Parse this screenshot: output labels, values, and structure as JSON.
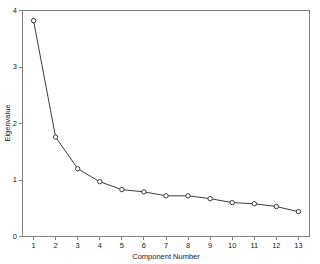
{
  "chart_data": {
    "type": "line",
    "title": "",
    "subtitle": "",
    "xlabel": "Component Number",
    "ylabel": "Eigenvalue",
    "categories": [
      1,
      2,
      3,
      4,
      5,
      6,
      7,
      8,
      9,
      10,
      11,
      12,
      13
    ],
    "x": [
      1,
      2,
      3,
      4,
      5,
      6,
      7,
      8,
      9,
      10,
      11,
      12,
      13
    ],
    "values": [
      3.82,
      1.76,
      1.2,
      0.97,
      0.83,
      0.79,
      0.72,
      0.72,
      0.67,
      0.6,
      0.58,
      0.53,
      0.44
    ],
    "series": [
      {
        "name": "Eigenvalue",
        "values": [
          3.82,
          1.76,
          1.2,
          0.97,
          0.83,
          0.79,
          0.72,
          0.72,
          0.67,
          0.6,
          0.58,
          0.53,
          0.44
        ]
      }
    ],
    "xlim": [
      0.5,
      13.5
    ],
    "ylim": [
      0,
      4
    ],
    "xticks": [
      "1",
      "2",
      "3",
      "4",
      "5",
      "6",
      "7",
      "8",
      "9",
      "10",
      "11",
      "12",
      "13"
    ],
    "yticks": [
      "0",
      "1",
      "2",
      "3",
      "4"
    ],
    "ytick_values": [
      0,
      1,
      2,
      3,
      4
    ],
    "grid": false,
    "legend": false,
    "legend_position": "none",
    "marker": "open-circle",
    "line_color": "#3c3c3c",
    "marker_fill": "#ffffff",
    "frame_color": "#808080",
    "background": "#ffffff"
  },
  "axes": {
    "y_title": "Eigenvalue",
    "x_title": "Component Number"
  }
}
